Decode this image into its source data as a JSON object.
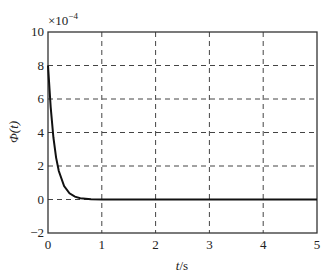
{
  "chart_data": {
    "type": "line",
    "title": "",
    "xlabel": "t/s",
    "ylabel": "Φ(t)",
    "y_multiplier": "×10^-4",
    "xlim": [
      0,
      5
    ],
    "ylim": [
      -2,
      10
    ],
    "xticks": [
      "0",
      "1",
      "2",
      "3",
      "4",
      "5"
    ],
    "yticks": [
      "-2",
      "0",
      "2",
      "4",
      "6",
      "8",
      "10"
    ],
    "grid": true,
    "series": [
      {
        "name": "Φ(t)",
        "x": [
          0,
          0.05,
          0.1,
          0.15,
          0.2,
          0.3,
          0.4,
          0.5,
          0.6,
          0.8,
          1.0,
          2.0,
          3.0,
          4.0,
          5.0
        ],
        "values": [
          8.0,
          5.5,
          3.7,
          2.5,
          1.7,
          0.8,
          0.37,
          0.17,
          0.08,
          0.02,
          0.0,
          0.0,
          0.0,
          0.0,
          0.0
        ]
      }
    ]
  },
  "labels": {
    "xlabel_italic": "t",
    "xlabel_unit": "/s",
    "ylabel": "Φ(t)",
    "multiplier_base": "×10",
    "multiplier_exp": "−4"
  }
}
